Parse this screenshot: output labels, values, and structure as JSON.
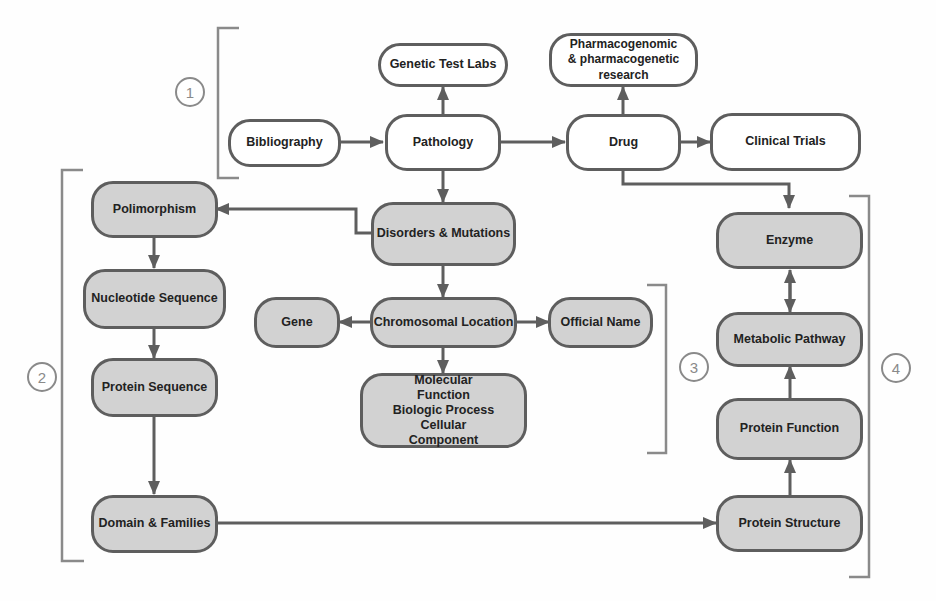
{
  "diagram": {
    "groups": [
      {
        "id": "1",
        "label": "1"
      },
      {
        "id": "2",
        "label": "2"
      },
      {
        "id": "3",
        "label": "3"
      },
      {
        "id": "4",
        "label": "4"
      }
    ],
    "nodes": {
      "genetic_test_labs": "Genetic Test Labs",
      "pharma_research": "Pharmacogenomic & pharmacogenetic research",
      "bibliography": "Bibliography",
      "pathology": "Pathology",
      "drug": "Drug",
      "clinical_trials": "Clinical Trials",
      "polimorphism": "Polimorphism",
      "disorders_mutations": "Disorders & Mutations",
      "nucleotide_sequence": "Nucleotide Sequence",
      "gene": "Gene",
      "chromosomal_location": "Chromosomal Location",
      "official_name": "Official Name",
      "protein_sequence": "Protein Sequence",
      "go_terms": "Molecular Function Biologic Process Cellular Component",
      "domain_families": "Domain & Families",
      "enzyme": "Enzyme",
      "metabolic_pathway": "Metabolic Pathway",
      "protein_function": "Protein Function",
      "protein_structure": "Protein Structure"
    },
    "edges": [
      {
        "from": "Bibliography",
        "to": "Pathology"
      },
      {
        "from": "Pathology",
        "to": "Genetic Test Labs"
      },
      {
        "from": "Pathology",
        "to": "Drug"
      },
      {
        "from": "Drug",
        "to": "Pharmacogenomic & pharmacogenetic research"
      },
      {
        "from": "Drug",
        "to": "Clinical Trials"
      },
      {
        "from": "Drug",
        "to": "Enzyme"
      },
      {
        "from": "Pathology",
        "to": "Disorders & Mutations"
      },
      {
        "from": "Disorders & Mutations",
        "to": "Polimorphism"
      },
      {
        "from": "Polimorphism",
        "to": "Nucleotide Sequence"
      },
      {
        "from": "Nucleotide Sequence",
        "to": "Protein Sequence"
      },
      {
        "from": "Protein Sequence",
        "to": "Domain & Families"
      },
      {
        "from": "Domain & Families",
        "to": "Protein Structure"
      },
      {
        "from": "Disorders & Mutations",
        "to": "Chromosomal Location"
      },
      {
        "from": "Chromosomal Location",
        "to": "Gene"
      },
      {
        "from": "Chromosomal Location",
        "to": "Official Name"
      },
      {
        "from": "Chromosomal Location",
        "to": "Molecular Function Biologic Process Cellular Component"
      },
      {
        "from": "Protein Structure",
        "to": "Protein Function"
      },
      {
        "from": "Protein Function",
        "to": "Metabolic Pathway"
      },
      {
        "from": "Metabolic Pathway",
        "to": "Enzyme",
        "bidirectional": true
      }
    ],
    "colors": {
      "stroke": "#5e5e5e",
      "fill_white": "#ffffff",
      "fill_gray": "#d2d2d2",
      "bracket": "#8a8a8a"
    }
  }
}
